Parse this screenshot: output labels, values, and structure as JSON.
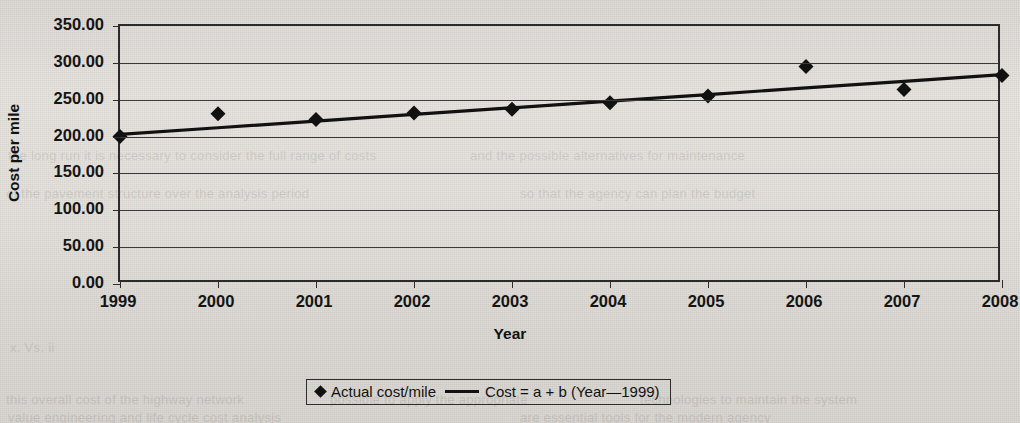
{
  "chart_data": {
    "type": "line",
    "title": "",
    "xlabel": "Year",
    "ylabel": "Cost per mile",
    "x": [
      1999,
      2000,
      2001,
      2002,
      2003,
      2004,
      2005,
      2006,
      2007,
      2008
    ],
    "xtick_labels": [
      "1999",
      "2000",
      "2001",
      "2002",
      "2003",
      "2004",
      "2005",
      "2006",
      "2007",
      "2008"
    ],
    "ytick_labels": [
      "0.00",
      "50.00",
      "100.00",
      "150.00",
      "200.00",
      "250.00",
      "300.00",
      "350.00"
    ],
    "ytick_values": [
      0,
      50,
      100,
      150,
      200,
      250,
      300,
      350
    ],
    "ylim": [
      0,
      350
    ],
    "xlim": [
      1999,
      2008
    ],
    "grid": "horizontal",
    "legend_position": "bottom-center",
    "series": [
      {
        "name": "Actual cost/mile",
        "marker": "diamond",
        "style": "markers",
        "color": "#111111",
        "values": [
          200.0,
          231.0,
          223.0,
          232.0,
          237.0,
          246.0,
          255.0,
          295.0,
          264.0,
          283.0
        ]
      },
      {
        "name": "Cost = a + b (Year—1999)",
        "marker": "none",
        "style": "line",
        "color": "#111111",
        "values": [
          203.0,
          212.0,
          221.0,
          230.0,
          239.0,
          248.0,
          257.0,
          266.0,
          275.0,
          284.0
        ]
      }
    ]
  },
  "axes": {
    "y_title": "Cost per mile",
    "x_title": "Year"
  },
  "legend": {
    "entries": [
      {
        "marker": "diamond",
        "label": "Actual cost/mile"
      },
      {
        "marker": "line",
        "label": "Cost = a + b (Year—1999)"
      }
    ]
  },
  "colors": {
    "ink": "#111111",
    "grid": "#3a3a3a",
    "paper": "#e3e0db"
  }
}
